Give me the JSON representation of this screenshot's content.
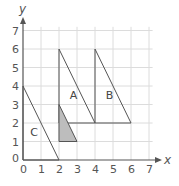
{
  "diagram": {
    "type": "coordinate-grid",
    "x_axis": {
      "label": "x",
      "min": 0,
      "max": 7,
      "ticks": [
        "0",
        "1",
        "2",
        "3",
        "4",
        "5",
        "6",
        "7"
      ]
    },
    "y_axis": {
      "label": "y",
      "min": 0,
      "max": 7,
      "ticks": [
        "1",
        "2",
        "3",
        "4",
        "5",
        "6",
        "7"
      ]
    },
    "origin_label": "0",
    "colors": {
      "grid": "#dcdcdc",
      "axis": "#555555",
      "shape_stroke": "#555555",
      "shaded_fill": "#bdbdbd"
    },
    "shapes": [
      {
        "label": "A",
        "vertices": [
          [
            2,
            2
          ],
          [
            2,
            6
          ],
          [
            4,
            2
          ]
        ],
        "label_pos": [
          2.6,
          3.3
        ],
        "shaded": false
      },
      {
        "label": "B",
        "vertices": [
          [
            4,
            2
          ],
          [
            4,
            6
          ],
          [
            6,
            2
          ]
        ],
        "label_pos": [
          4.6,
          3.3
        ],
        "shaded": false
      },
      {
        "label": "C",
        "vertices": [
          [
            0,
            0
          ],
          [
            0,
            4
          ],
          [
            2,
            0
          ]
        ],
        "label_pos": [
          0.4,
          1.3
        ],
        "shaded": false
      },
      {
        "label": "",
        "vertices": [
          [
            2,
            1
          ],
          [
            2,
            3
          ],
          [
            3,
            1
          ]
        ],
        "shaded": true
      }
    ]
  }
}
